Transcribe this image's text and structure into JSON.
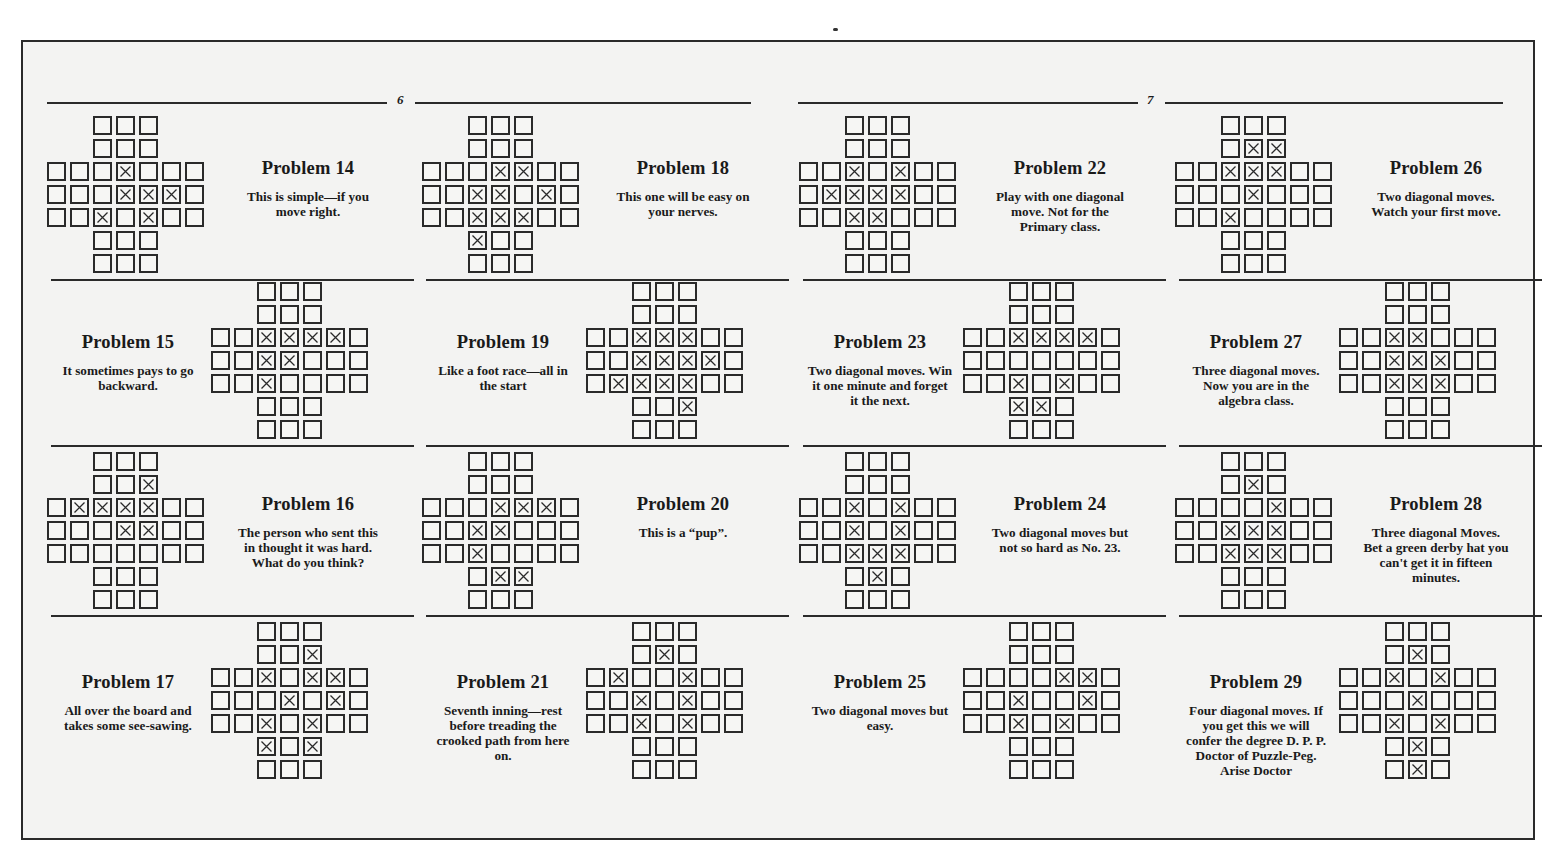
{
  "pages": [
    {
      "number": "6"
    },
    {
      "number": "7"
    }
  ],
  "board_spec": {
    "size": 7,
    "shape": "english-cross-33-holes",
    "marker": "X"
  },
  "columns": [
    {
      "problems": [
        {
          "title": "Problem 14",
          "description": "This is simple—if you move right.",
          "board_side": "left",
          "pegs": [
            [
              2,
              3
            ],
            [
              3,
              3
            ],
            [
              3,
              4
            ],
            [
              3,
              5
            ],
            [
              4,
              2
            ],
            [
              4,
              4
            ]
          ]
        },
        {
          "title": "Problem 15",
          "description": "It sometimes pays to go backward.",
          "board_side": "right",
          "pegs": [
            [
              2,
              2
            ],
            [
              2,
              3
            ],
            [
              2,
              4
            ],
            [
              2,
              5
            ],
            [
              3,
              2
            ],
            [
              3,
              3
            ],
            [
              4,
              2
            ]
          ]
        },
        {
          "title": "Problem 16",
          "description": "The person who sent this in thought it was hard. What do you think?",
          "board_side": "left",
          "pegs": [
            [
              1,
              4
            ],
            [
              2,
              1
            ],
            [
              2,
              2
            ],
            [
              2,
              3
            ],
            [
              2,
              4
            ],
            [
              3,
              3
            ],
            [
              3,
              4
            ]
          ]
        },
        {
          "title": "Problem 17",
          "description": "All over the board and takes some see-sawing.",
          "board_side": "right",
          "pegs": [
            [
              1,
              4
            ],
            [
              2,
              2
            ],
            [
              2,
              4
            ],
            [
              2,
              5
            ],
            [
              3,
              3
            ],
            [
              3,
              5
            ],
            [
              4,
              2
            ],
            [
              4,
              4
            ],
            [
              5,
              2
            ],
            [
              5,
              4
            ]
          ]
        }
      ]
    },
    {
      "problems": [
        {
          "title": "Problem 18",
          "description": "This one will be easy on your nerves.",
          "board_side": "left",
          "pegs": [
            [
              2,
              3
            ],
            [
              2,
              4
            ],
            [
              3,
              2
            ],
            [
              3,
              3
            ],
            [
              3,
              5
            ],
            [
              4,
              2
            ],
            [
              4,
              3
            ],
            [
              4,
              4
            ],
            [
              5,
              2
            ]
          ]
        },
        {
          "title": "Problem 19",
          "description": "Like a foot race—all in the start",
          "board_side": "right",
          "pegs": [
            [
              2,
              2
            ],
            [
              2,
              3
            ],
            [
              2,
              4
            ],
            [
              3,
              2
            ],
            [
              3,
              3
            ],
            [
              3,
              4
            ],
            [
              3,
              5
            ],
            [
              4,
              1
            ],
            [
              4,
              2
            ],
            [
              4,
              3
            ],
            [
              4,
              4
            ],
            [
              5,
              4
            ]
          ]
        },
        {
          "title": "Problem 20",
          "description": "This is a “pup”.",
          "board_side": "left",
          "pegs": [
            [
              2,
              3
            ],
            [
              2,
              4
            ],
            [
              2,
              5
            ],
            [
              3,
              2
            ],
            [
              3,
              3
            ],
            [
              4,
              2
            ],
            [
              5,
              3
            ],
            [
              5,
              4
            ]
          ]
        },
        {
          "title": "Problem 21",
          "description": "Seventh inning—rest before treading the crooked path from here on.",
          "board_side": "right",
          "pegs": [
            [
              1,
              3
            ],
            [
              2,
              1
            ],
            [
              2,
              4
            ],
            [
              3,
              2
            ],
            [
              3,
              4
            ],
            [
              4,
              2
            ],
            [
              4,
              4
            ]
          ]
        }
      ]
    },
    {
      "problems": [
        {
          "title": "Problem 22",
          "description": "Play with one diagonal move. Not for the Primary class.",
          "board_side": "left",
          "pegs": [
            [
              2,
              2
            ],
            [
              2,
              4
            ],
            [
              3,
              1
            ],
            [
              3,
              2
            ],
            [
              3,
              3
            ],
            [
              3,
              4
            ],
            [
              4,
              2
            ],
            [
              4,
              3
            ]
          ]
        },
        {
          "title": "Problem 23",
          "description": "Two diagonal moves. Win it one minute and forget it the next.",
          "board_side": "right",
          "pegs": [
            [
              2,
              2
            ],
            [
              2,
              3
            ],
            [
              2,
              4
            ],
            [
              2,
              5
            ],
            [
              4,
              2
            ],
            [
              4,
              4
            ],
            [
              5,
              2
            ],
            [
              5,
              3
            ]
          ]
        },
        {
          "title": "Problem 24",
          "description": "Two diagonal moves but not so hard as No. 23.",
          "board_side": "left",
          "pegs": [
            [
              2,
              2
            ],
            [
              2,
              4
            ],
            [
              3,
              2
            ],
            [
              3,
              4
            ],
            [
              4,
              2
            ],
            [
              4,
              3
            ],
            [
              4,
              4
            ],
            [
              5,
              3
            ]
          ]
        },
        {
          "title": "Problem 25",
          "description": "Two diagonal moves but easy.",
          "board_side": "right",
          "pegs": [
            [
              2,
              4
            ],
            [
              2,
              5
            ],
            [
              3,
              2
            ],
            [
              3,
              5
            ],
            [
              4,
              2
            ],
            [
              4,
              4
            ]
          ]
        }
      ]
    },
    {
      "problems": [
        {
          "title": "Problem 26",
          "description": "Two diagonal moves. Watch your first move.",
          "board_side": "left",
          "pegs": [
            [
              1,
              3
            ],
            [
              1,
              4
            ],
            [
              2,
              2
            ],
            [
              2,
              3
            ],
            [
              2,
              4
            ],
            [
              3,
              3
            ],
            [
              4,
              2
            ]
          ]
        },
        {
          "title": "Problem 27",
          "description": "Three diagonal moves. Now you are in the algebra class.",
          "board_side": "right",
          "pegs": [
            [
              2,
              2
            ],
            [
              2,
              3
            ],
            [
              3,
              2
            ],
            [
              3,
              3
            ],
            [
              3,
              4
            ],
            [
              4,
              2
            ],
            [
              4,
              3
            ],
            [
              4,
              4
            ]
          ]
        },
        {
          "title": "Problem 28",
          "description": "Three diagonal Moves. Bet a green derby hat you can't get it in fifteen minutes.",
          "board_side": "left",
          "pegs": [
            [
              1,
              3
            ],
            [
              2,
              4
            ],
            [
              3,
              2
            ],
            [
              3,
              3
            ],
            [
              3,
              4
            ],
            [
              4,
              2
            ],
            [
              4,
              3
            ],
            [
              4,
              4
            ]
          ]
        },
        {
          "title": "Problem 29",
          "description": "Four diagonal moves. If you get this we will confer the degree D. P. P. Doctor of Puzzle-Peg. Arise Doctor",
          "board_side": "right",
          "pegs": [
            [
              1,
              3
            ],
            [
              2,
              2
            ],
            [
              2,
              4
            ],
            [
              3,
              3
            ],
            [
              4,
              2
            ],
            [
              4,
              4
            ],
            [
              5,
              3
            ],
            [
              6,
              3
            ]
          ]
        }
      ]
    }
  ],
  "colors": {
    "ink": "#2a2a2a",
    "paper": "#f3f3f2",
    "background": "#ffffff"
  }
}
